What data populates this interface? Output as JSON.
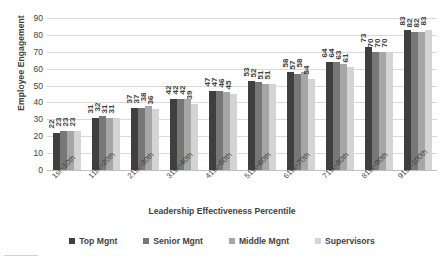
{
  "chart_data": {
    "type": "bar",
    "title": "",
    "xlabel": "Leadership Effectiveness Percentile",
    "ylabel": "Employee Engagement",
    "ylim": [
      0,
      90
    ],
    "ytick_step": 10,
    "yticks": [
      90,
      80,
      70,
      60,
      50,
      40,
      30,
      20,
      10,
      0
    ],
    "grid": true,
    "legend_position": "bottom",
    "show_data_labels": true,
    "data_label_orientation": "vertical",
    "categories": [
      "1st~10th",
      "11th~20th",
      "21st~30th",
      "31st~40th",
      "41st~50th",
      "51st~60th",
      "61st~70th",
      "71st~80th",
      "81st~90th",
      "91st~100th"
    ],
    "series": [
      {
        "name": "Top Mgnt",
        "color": "#3f3f3f",
        "values": [
          22,
          31,
          37,
          42,
          47,
          53,
          58,
          64,
          73,
          83
        ]
      },
      {
        "name": "Senior Mgnt",
        "color": "#777777",
        "values": [
          23,
          32,
          37,
          42,
          47,
          52,
          57,
          64,
          70,
          82
        ]
      },
      {
        "name": "Middle Mgnt",
        "color": "#a6a6a6",
        "values": [
          23,
          31,
          38,
          42,
          46,
          51,
          58,
          63,
          70,
          82
        ]
      },
      {
        "name": "Supervisors",
        "color": "#d4d4d4",
        "values": [
          23,
          31,
          36,
          39,
          45,
          51,
          54,
          61,
          70,
          83
        ]
      }
    ]
  },
  "colors": {
    "gridline": "#d9d9d9",
    "baseline": "#bfbfbf",
    "text": "#3f3f3f",
    "background": "#ffffff"
  }
}
